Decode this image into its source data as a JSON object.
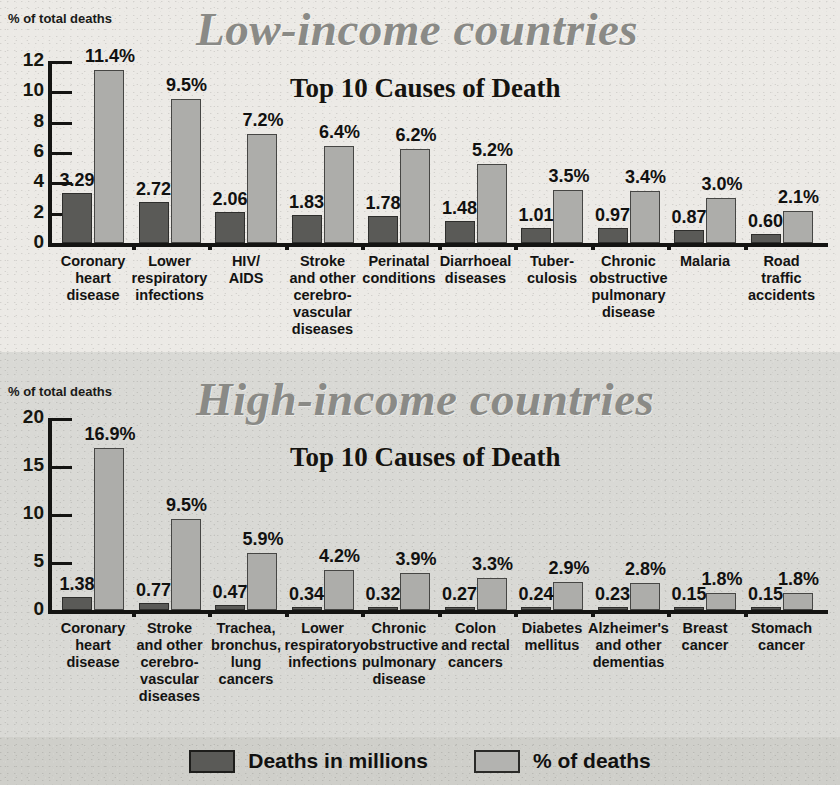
{
  "legend": {
    "items": [
      {
        "label": "Deaths in millions",
        "color": "#5a5a57",
        "key": "deaths_millions"
      },
      {
        "label": "% of deaths",
        "color": "#adadaa",
        "key": "pct_of_deaths"
      }
    ]
  },
  "panels": [
    {
      "id": "low-income",
      "title": "Low-income countries",
      "subtitle": "Top 10 Causes of Death",
      "axis_caption": "% of total deaths"
    },
    {
      "id": "high-income",
      "title": "High-income countries",
      "subtitle": "Top 10 Causes of Death",
      "axis_caption": "% of total deaths"
    }
  ],
  "chart_data": [
    {
      "type": "bar",
      "title": "Low-income countries",
      "subtitle": "Top 10 Causes of Death",
      "xlabel": "",
      "ylabel": "% of total deaths",
      "ylim": [
        0,
        12
      ],
      "yticks": [
        0,
        2,
        4,
        6,
        8,
        10,
        12
      ],
      "ytick_labels": [
        "0",
        "2",
        "4",
        "6",
        "8",
        "10",
        "12"
      ],
      "grid": false,
      "legend_position": "bottom",
      "categories": [
        "Coronary\nheart\ndisease",
        "Lower\nrespiratory\ninfections",
        "HIV/\nAIDS",
        "Stroke\nand other\ncerebro-\nvascular\ndiseases",
        "Perinatal\nconditions",
        "Diarrhoeal\ndiseases",
        "Tuber-\nculosis",
        "Chronic\nobstructive\npulmonary\ndisease",
        "Malaria",
        "Road\ntraffic\naccidents"
      ],
      "series": [
        {
          "name": "Deaths in millions",
          "color": "#5a5a57",
          "values": [
            3.29,
            2.72,
            2.06,
            1.83,
            1.78,
            1.48,
            1.01,
            0.97,
            0.87,
            0.6
          ],
          "labels": [
            "3.29",
            "2.72",
            "2.06",
            "1.83",
            "1.78",
            "1.48",
            "1.01",
            "0.97",
            "0.87",
            "0.60"
          ]
        },
        {
          "name": "% of deaths",
          "color": "#adadaa",
          "values": [
            11.4,
            9.5,
            7.2,
            6.4,
            6.2,
            5.2,
            3.5,
            3.4,
            3.0,
            2.1
          ],
          "labels": [
            "11.4%",
            "9.5%",
            "7.2%",
            "6.4%",
            "6.2%",
            "5.2%",
            "3.5%",
            "3.4%",
            "3.0%",
            "2.1%"
          ]
        }
      ]
    },
    {
      "type": "bar",
      "title": "High-income countries",
      "subtitle": "Top 10 Causes of Death",
      "xlabel": "",
      "ylabel": "% of total deaths",
      "ylim": [
        0,
        20
      ],
      "yticks": [
        0,
        5,
        10,
        15,
        20
      ],
      "ytick_labels": [
        "0",
        "5",
        "10",
        "15",
        "20"
      ],
      "grid": false,
      "legend_position": "bottom",
      "categories": [
        "Coronary\nheart\ndisease",
        "Stroke\nand other\ncerebro-\nvascular\ndiseases",
        "Trachea,\nbronchus,\nlung\ncancers",
        "Lower\nrespiratory\ninfections",
        "Chronic\nobstructive\npulmonary\ndisease",
        "Colon\nand rectal\ncancers",
        "Diabetes\nmellitus",
        "Alzheimer's\nand other\ndementias",
        "Breast\ncancer",
        "Stomach\ncancer"
      ],
      "series": [
        {
          "name": "Deaths in millions",
          "color": "#5a5a57",
          "values": [
            1.38,
            0.77,
            0.47,
            0.34,
            0.32,
            0.27,
            0.24,
            0.23,
            0.15,
            0.15
          ],
          "labels": [
            "1.38",
            "0.77",
            "0.47",
            "0.34",
            "0.32",
            "0.27",
            "0.24",
            "0.23",
            "0.15",
            "0.15"
          ]
        },
        {
          "name": "% of deaths",
          "color": "#adadaa",
          "values": [
            16.9,
            9.5,
            5.9,
            4.2,
            3.9,
            3.3,
            2.9,
            2.8,
            1.8,
            1.8
          ],
          "labels": [
            "16.9%",
            "9.5%",
            "5.9%",
            "4.2%",
            "3.9%",
            "3.3%",
            "2.9%",
            "2.8%",
            "1.8%",
            "1.8%"
          ]
        }
      ]
    }
  ]
}
